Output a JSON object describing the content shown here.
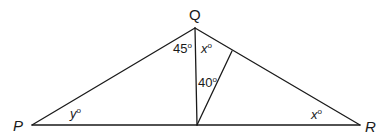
{
  "diagram": {
    "type": "geometry-triangle",
    "vertices": {
      "P": {
        "label": "P",
        "x": 32,
        "y": 125
      },
      "Q": {
        "label": "Q",
        "x": 195,
        "y": 28
      },
      "R": {
        "label": "R",
        "x": 360,
        "y": 125
      },
      "D": {
        "label": "",
        "x": 197,
        "y": 125
      },
      "E": {
        "label": "",
        "x": 232,
        "y": 51
      }
    },
    "segments": [
      {
        "name": "side-pq",
        "from": "P",
        "to": "Q"
      },
      {
        "name": "side-qr",
        "from": "Q",
        "to": "R"
      },
      {
        "name": "side-pr",
        "from": "P",
        "to": "R"
      },
      {
        "name": "segment-qd",
        "from": "Q",
        "to": "D"
      },
      {
        "name": "segment-de",
        "from": "D",
        "to": "E"
      }
    ],
    "angle_labels": {
      "pqd": {
        "value": "45",
        "unit": "o"
      },
      "dqe": {
        "value": "x",
        "unit": "o"
      },
      "qde": {
        "value": "40",
        "unit": "o"
      },
      "qpr": {
        "value": "y",
        "unit": "o"
      },
      "qrp": {
        "value": "x",
        "unit": "o"
      }
    },
    "colors": {
      "stroke": "#1a1a1a",
      "background": "#ffffff"
    }
  }
}
